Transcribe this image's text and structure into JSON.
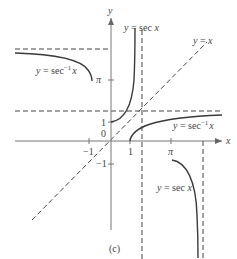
{
  "figure": {
    "caption": "(c)",
    "axes": {
      "x_label": "x",
      "y_label": "y",
      "origin_label": "0",
      "x_ticks": [
        "-1",
        "1",
        "π"
      ],
      "y_ticks": [
        "1",
        "-1",
        "π"
      ]
    },
    "curves": {
      "sec_upper": "y = sec x",
      "sec_lower": "y = sec x",
      "arcsec_left": "y = sec⁻¹ x",
      "arcsec_right": "y = sec⁻¹ x",
      "identity": "y = x"
    },
    "labels": {
      "sec_label_top_prefix": "y = sec ",
      "sec_label_top_var": "x",
      "sec_label_bottom_prefix": "y = sec ",
      "sec_label_bottom_var": "x",
      "arcsec_left_prefix": "y = sec",
      "arcsec_left_sup": "−1",
      "arcsec_left_var": "x",
      "arcsec_right_prefix": "y = sec",
      "arcsec_right_sup": "−1",
      "arcsec_right_var": "x",
      "identity_prefix": "y = ",
      "identity_var": "x",
      "tick_neg1_x": "−1",
      "tick_1_x": "1",
      "tick_pi_x": "π",
      "tick_1_y": "1",
      "tick_neg1_y": "−1",
      "tick_pi_y": "π",
      "origin": "0",
      "axis_x": "x",
      "axis_y": "y"
    },
    "colors": {
      "ink": "#444444",
      "curve": "#3a3a3a",
      "background": "#ffffff"
    }
  }
}
